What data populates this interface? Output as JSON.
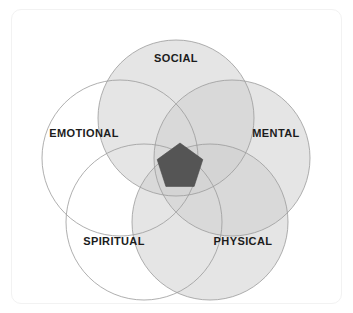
{
  "diagram": {
    "type": "venn",
    "background_color": "#ffffff",
    "frame_color": "#f2f2f2",
    "label_color": "#1c1c1c",
    "outline_color": "#9a9a9a",
    "center_shape": {
      "name": "center-pentagon",
      "shape": "pentagon",
      "fill_color": "#555555",
      "center_x": 180,
      "center_y": 167,
      "radius": 24,
      "rotation_deg": 0
    },
    "circles": [
      {
        "id": "social",
        "label": "SOCIAL",
        "cx": 176,
        "cy": 118,
        "r": 78,
        "fill_color": "#cfcfcf",
        "fill_opacity": 0.55,
        "label_x": 176,
        "label_y": 58
      },
      {
        "id": "mental",
        "label": "MENTAL",
        "cx": 232,
        "cy": 158,
        "r": 78,
        "fill_color": "#cfcfcf",
        "fill_opacity": 0.55,
        "label_x": 276,
        "label_y": 133
      },
      {
        "id": "physical",
        "label": "PHYSICAL",
        "cx": 210,
        "cy": 222,
        "r": 78,
        "fill_color": "#cfcfcf",
        "fill_opacity": 0.55,
        "label_x": 243,
        "label_y": 241
      },
      {
        "id": "spiritual",
        "label": "SPIRITUAL",
        "cx": 144,
        "cy": 222,
        "r": 78,
        "fill_color": "#ffffff",
        "fill_opacity": 0.0,
        "label_x": 114,
        "label_y": 241
      },
      {
        "id": "emotional",
        "label": "EMOTIONAL",
        "cx": 120,
        "cy": 158,
        "r": 78,
        "fill_color": "#ffffff",
        "fill_opacity": 0.0,
        "label_x": 84,
        "label_y": 133
      }
    ]
  }
}
